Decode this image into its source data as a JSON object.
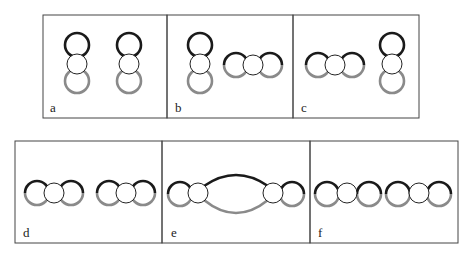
{
  "colors": {
    "border": "#444444",
    "dark_arc": "#1a1a1a",
    "light_arc": "#8a8a8a",
    "inner_circle": "#222222",
    "background": "#ffffff"
  },
  "panels": [
    {
      "id": "a",
      "label": "a",
      "description": "two vertical orbital dimers side by side"
    },
    {
      "id": "b",
      "label": "b",
      "description": "vertical dimer and horizontal dimer"
    },
    {
      "id": "c",
      "label": "c",
      "description": "horizontal dimer and vertical dimer"
    },
    {
      "id": "d",
      "label": "d",
      "description": "two horizontal dimers side by side"
    },
    {
      "id": "e",
      "label": "e",
      "description": "two dimers bridged by a shared elongated orbital"
    },
    {
      "id": "f",
      "label": "f",
      "description": "two horizontal dimers in contact forming a chain"
    }
  ]
}
